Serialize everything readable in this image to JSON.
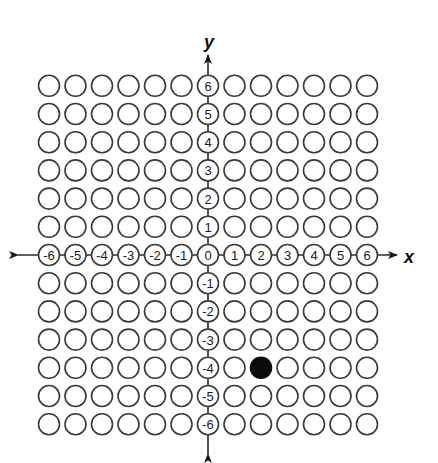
{
  "diagram": {
    "type": "coordinate-grid",
    "x_axis": {
      "label": "x",
      "ticks": [
        "-6",
        "-5",
        "-4",
        "-3",
        "-2",
        "-1",
        "0",
        "1",
        "2",
        "3",
        "4",
        "5",
        "6"
      ],
      "min": -6,
      "max": 6
    },
    "y_axis": {
      "label": "y",
      "ticks": [
        "6",
        "5",
        "4",
        "3",
        "2",
        "1",
        "-1",
        "-2",
        "-3",
        "-4",
        "-5",
        "-6"
      ],
      "min": -6,
      "max": 6
    },
    "grid": {
      "columns": 13,
      "rows": 13,
      "cell_shape": "circle"
    },
    "highlighted_points": [
      {
        "x": 2,
        "y": -4,
        "style": "filled"
      }
    ],
    "colors": {
      "stroke": "#3a3a3a",
      "filled": "#0a0a0a",
      "background": "#ffffff"
    }
  },
  "layout": {
    "origin_px": [
      208,
      255
    ],
    "col_pitch": 26.5,
    "row_pitch": 28.2,
    "radius": 10.5
  }
}
